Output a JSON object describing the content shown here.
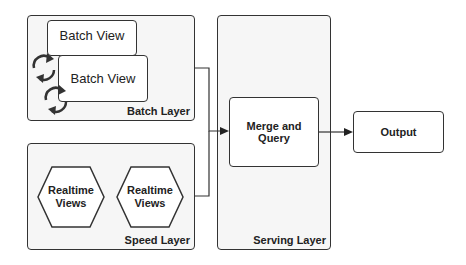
{
  "diagram": {
    "batch_layer": {
      "label": "Batch Layer",
      "views": [
        {
          "label": "Batch View",
          "icon": "refresh-icon"
        },
        {
          "label": "Batch View",
          "icon": "refresh-icon"
        }
      ]
    },
    "speed_layer": {
      "label": "Speed Layer",
      "views": [
        {
          "label": "Realtime Views"
        },
        {
          "label": "Realtime Views"
        }
      ]
    },
    "serving_layer": {
      "label": "Serving Layer",
      "node": {
        "label": "Merge and Query"
      }
    },
    "output": {
      "label": "Output"
    },
    "edges": [
      {
        "from": "batch_layer",
        "to": "merge_and_query"
      },
      {
        "from": "speed_layer",
        "to": "merge_and_query"
      },
      {
        "from": "merge_and_query",
        "to": "output"
      }
    ],
    "colors": {
      "stroke": "#333333",
      "layer_fill": "#f6f6f6",
      "node_fill": "#ffffff",
      "text": "#222222"
    }
  }
}
